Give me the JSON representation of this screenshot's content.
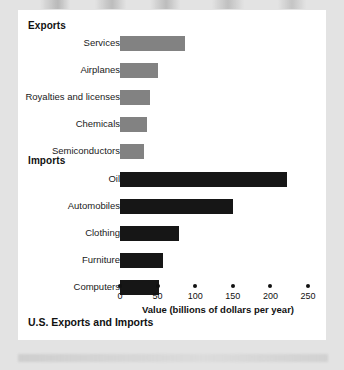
{
  "figure": {
    "caption": "U.S. Exports and Imports",
    "group_headings": {
      "exports": "Exports",
      "imports": "Imports"
    },
    "colors": {
      "export_bar": "#828282",
      "import_bar": "#161616",
      "panel_background": "#ffffff",
      "page_background": "#e3e3e3",
      "text": "#111111"
    }
  },
  "chart_data": {
    "type": "bar",
    "orientation": "horizontal",
    "title": "U.S. Exports and Imports",
    "xlabel": "Value (billions of dollars per year)",
    "ylabel": "",
    "xlim": [
      0,
      250
    ],
    "xticks": [
      0,
      50,
      100,
      150,
      200,
      250
    ],
    "xticklabels": [
      "0",
      "50",
      "100",
      "150",
      "200",
      "250"
    ],
    "grid": false,
    "legend": false,
    "groups": [
      {
        "name": "Exports",
        "color": "#828282",
        "categories": [
          "Services",
          "Airplanes",
          "Royalties and licenses",
          "Chemicals",
          "Semiconductors"
        ],
        "values": [
          86,
          50,
          40,
          36,
          32
        ]
      },
      {
        "name": "Imports",
        "color": "#161616",
        "categories": [
          "Oil",
          "Automobiles",
          "Clothing",
          "Furniture",
          "Computers"
        ],
        "values": [
          222,
          150,
          78,
          57,
          52
        ]
      }
    ],
    "categories": [
      "Services",
      "Airplanes",
      "Royalties and licenses",
      "Chemicals",
      "Semiconductors",
      "Oil",
      "Automobiles",
      "Clothing",
      "Furniture",
      "Computers"
    ],
    "values": [
      86,
      50,
      40,
      36,
      32,
      222,
      150,
      78,
      57,
      52
    ]
  }
}
